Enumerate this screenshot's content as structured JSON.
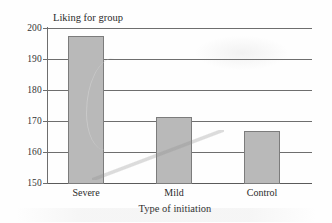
{
  "chart_data": {
    "type": "bar",
    "title": "",
    "xlabel": "Type of initiation",
    "ylabel": "Liking for group",
    "categories": [
      "Severe",
      "Mild",
      "Control"
    ],
    "values": [
      197.5,
      171.3,
      166.8
    ],
    "ylim": [
      150,
      200
    ],
    "yticks": [
      200,
      190,
      180,
      170,
      160,
      150
    ],
    "ytick_labels": [
      "200",
      "190",
      "180",
      "170",
      "160",
      "150"
    ],
    "grid": true,
    "legend": "none",
    "series": [
      {
        "name": "Liking for group",
        "values": [
          197.5,
          171.3,
          166.8
        ]
      }
    ],
    "bar_color": "#b9b9b9",
    "bar_border_color": "#7c7c7c",
    "axis_color": "#6e6e6e"
  }
}
